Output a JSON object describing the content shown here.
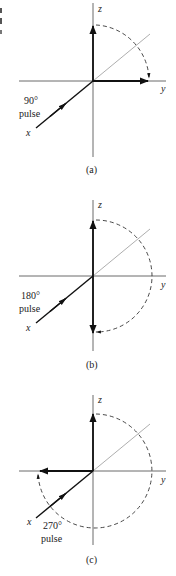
{
  "figure": {
    "edge_fragments": [
      "l",
      "d",
      "e"
    ],
    "panels": [
      {
        "id": "a",
        "caption": "(a)",
        "pulse_angle": "90°",
        "pulse_word": "pulse",
        "axis_labels": {
          "x": "x",
          "y": "y",
          "z": "z"
        },
        "magnetization_final": "+y"
      },
      {
        "id": "b",
        "caption": "(b)",
        "pulse_angle": "180°",
        "pulse_word": "pulse",
        "axis_labels": {
          "x": "x",
          "y": "y",
          "z": "z"
        },
        "magnetization_final": "-z"
      },
      {
        "id": "c",
        "caption": "(c)",
        "pulse_angle": "270°",
        "pulse_word": "pulse",
        "axis_labels": {
          "x": "x",
          "y": "y",
          "z": "z"
        },
        "magnetization_final": "-y"
      }
    ]
  }
}
